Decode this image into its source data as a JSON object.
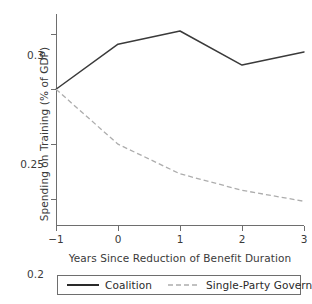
{
  "chart_data": {
    "type": "line",
    "title": "",
    "xlabel": "Years Since Reduction of Benefit Duration",
    "ylabel": "Spending on Training (% of GDP)",
    "x": [
      -1,
      0,
      1,
      2,
      3
    ],
    "xtick_labels": [
      "−1",
      "0",
      "1",
      "2",
      "3"
    ],
    "ytick_labels": [
      "0.15",
      "0.2",
      "0.25",
      "0.3"
    ],
    "yticks": [
      0.15,
      0.2,
      0.25,
      0.3
    ],
    "xlim": [
      -1,
      3
    ],
    "ylim": [
      0.1255,
      0.3185
    ],
    "grid": false,
    "legend_position": "bottom",
    "series": [
      {
        "name": "Coalition",
        "values": [
          0.25,
          0.291,
          0.303,
          0.272,
          0.284
        ],
        "color": "#3a3a3a",
        "style": "solid"
      },
      {
        "name": "Single-Party Government",
        "values": [
          0.25,
          0.2,
          0.173,
          0.158,
          0.148
        ],
        "color": "#adadad",
        "style": "dashed"
      }
    ]
  },
  "legend": {
    "entries": [
      {
        "label": "Coalition"
      },
      {
        "label": "Single-Party Government"
      }
    ]
  },
  "colors": {
    "axis": "#6e6e6e",
    "text": "#3a3a3a",
    "coalition": "#3a3a3a",
    "single_party": "#adadad",
    "background": "#ffffff"
  }
}
